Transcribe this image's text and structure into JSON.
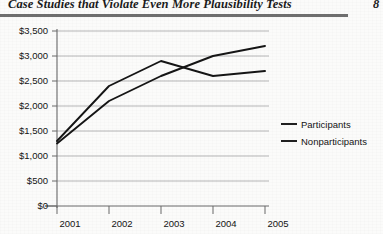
{
  "header": {
    "title": "Case Studies that Violate Even More Plausibility Tests",
    "page_number": "8"
  },
  "chart_data": {
    "type": "line",
    "title": "",
    "xlabel": "",
    "ylabel": "",
    "categories": [
      "2001",
      "2002",
      "2003",
      "2004",
      "2005"
    ],
    "x": [
      2001,
      2002,
      2003,
      2004,
      2005
    ],
    "series": [
      {
        "name": "Participants",
        "values": [
          1300,
          2400,
          2900,
          2600,
          2700
        ]
      },
      {
        "name": "Nonparticipants",
        "values": [
          1250,
          2100,
          2600,
          3000,
          3200
        ]
      }
    ],
    "ylim": [
      0,
      3500
    ],
    "ytick_values": [
      0,
      500,
      1000,
      1500,
      2000,
      2500,
      3000,
      3500
    ],
    "ytick_labels": [
      "$0",
      "$500",
      "$1,000",
      "$1,500",
      "$2,000",
      "$2,500",
      "$3,000",
      "$3,500"
    ],
    "xtick_labels": [
      "2001",
      "2002",
      "2003",
      "2004",
      "2005"
    ],
    "grid": true,
    "grid_axis": "y",
    "legend": [
      "Participants",
      "Nonparticipants"
    ],
    "legend_position": "right",
    "line_color": "#151515",
    "grid_color": "#9a9a9a",
    "axis_color": "#6a6a6a"
  }
}
